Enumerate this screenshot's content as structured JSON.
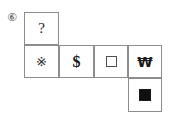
{
  "question": {
    "number_label": "⑥",
    "number": 5
  },
  "net": {
    "description": "cube net puzzle grid",
    "rows": 3,
    "cols": 4,
    "cells": [
      {
        "row": 0,
        "col": 0,
        "kind": "text",
        "name": "cell-unknown",
        "label": "?"
      },
      {
        "row": 1,
        "col": 0,
        "kind": "text",
        "name": "cell-snowflake",
        "label": "※"
      },
      {
        "row": 1,
        "col": 1,
        "kind": "text",
        "name": "cell-dollar",
        "label": "$"
      },
      {
        "row": 1,
        "col": 2,
        "kind": "shape",
        "name": "cell-open-square",
        "label": "□"
      },
      {
        "row": 1,
        "col": 3,
        "kind": "text",
        "name": "cell-won",
        "label": "₩"
      },
      {
        "row": 2,
        "col": 3,
        "kind": "shape",
        "name": "cell-filled-square",
        "label": "■"
      }
    ]
  },
  "colors": {
    "border": "#8d8d8d",
    "glyph": "#1a1a1a",
    "number": "#4a4a4a",
    "background": "#ffffff"
  }
}
